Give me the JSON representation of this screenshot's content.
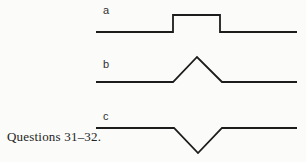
{
  "figure": {
    "caption": "Questions 31–32.",
    "line_color": "#1c1c1c",
    "background_color": "#fbfbf9",
    "waveforms": [
      {
        "label": "a",
        "shape": "rectangular-pulse",
        "points": "96,32 173,32 173,15 220,15 220,32 297,32"
      },
      {
        "label": "b",
        "shape": "triangular-pulse-upward",
        "points": "96,82 173,82 197,57 222,82 297,82"
      },
      {
        "label": "c",
        "shape": "triangular-pulse-inverted",
        "points": "96,128 174,128 198,153 222,128 297,128"
      }
    ]
  }
}
